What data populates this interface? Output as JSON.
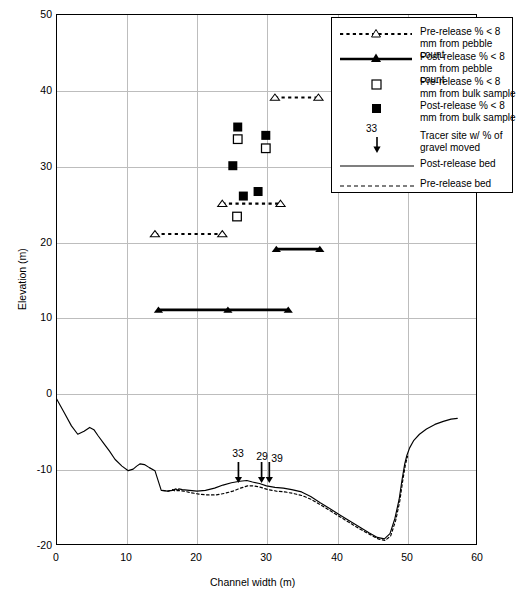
{
  "chart_data": {
    "type": "scatter",
    "title": "",
    "xlabel": "Channel width (m)",
    "ylabel": "Elevation (m)",
    "xlim": [
      0,
      60
    ],
    "ylim": [
      -20,
      50
    ],
    "xticks": [
      0,
      10,
      20,
      30,
      40,
      50,
      60
    ],
    "yticks": [
      -20,
      -10,
      0,
      10,
      20,
      30,
      40,
      50
    ],
    "grid": true,
    "legend_position": "top-right inside",
    "series": [
      {
        "name": "Pre-release % < 8 mm from pebble count",
        "style": "dashed-line-open-triangle",
        "segments": [
          {
            "x": [
              14.1,
              23.7
            ],
            "y": [
              21,
              21
            ]
          },
          {
            "x": [
              23.7,
              32.0
            ],
            "y": [
              25,
              25
            ]
          },
          {
            "x": [
              31.2,
              37.4
            ],
            "y": [
              39,
              39
            ]
          }
        ]
      },
      {
        "name": "Post-release % < 8 mm from pebble count",
        "style": "solid-line-filled-triangle",
        "segments": [
          {
            "x": [
              14.6,
              24.5,
              33.1
            ],
            "y": [
              11,
              11,
              11
            ]
          },
          {
            "x": [
              31.4,
              37.6
            ],
            "y": [
              19,
              19
            ]
          }
        ]
      },
      {
        "name": "Pre-release % < 8 mm from bulk sample",
        "style": "open-square",
        "points": [
          {
            "x": 25.9,
            "y": 33.5
          },
          {
            "x": 29.9,
            "y": 32.3
          },
          {
            "x": 25.8,
            "y": 23.3
          }
        ]
      },
      {
        "name": "Post-release % < 8 mm from bulk sample",
        "style": "filled-square",
        "points": [
          {
            "x": 25.9,
            "y": 35.1
          },
          {
            "x": 29.9,
            "y": 34.0
          },
          {
            "x": 25.2,
            "y": 30.0
          },
          {
            "x": 26.7,
            "y": 26.0
          },
          {
            "x": 28.8,
            "y": 26.6
          }
        ]
      },
      {
        "name": "Tracer site w/ % of gravel moved",
        "style": "down-arrow-with-label",
        "points": [
          {
            "x": 26.0,
            "label": "33"
          },
          {
            "x": 29.3,
            "label": "29"
          },
          {
            "x": 30.4,
            "label": "39"
          }
        ]
      },
      {
        "name": "Post-release bed",
        "style": "solid-line",
        "x": [
          0.0,
          1.2,
          2.2,
          3.1,
          4.0,
          4.8,
          5.4,
          6.0,
          6.8,
          7.6,
          8.4,
          9.4,
          10.3,
          11.0,
          11.5,
          12.0,
          12.6,
          13.3,
          14.1,
          15.0,
          15.9,
          16.6,
          17.1,
          17.3,
          17.5,
          18.0,
          19.0,
          20.1,
          21.3,
          22.6,
          23.8,
          25.0,
          26.2,
          27.2,
          28.0,
          29.0,
          30.0,
          31.2,
          32.4,
          33.6,
          35.0,
          36.3,
          37.6,
          39.0,
          40.4,
          41.8,
          43.2,
          44.6,
          45.8,
          46.8,
          47.6,
          48.3,
          48.9,
          49.3,
          49.7,
          50.0,
          50.4,
          51.0,
          51.8,
          52.8,
          54.0,
          55.2,
          56.3,
          57.2
        ],
        "y": [
          -0.6,
          -2.6,
          -4.3,
          -5.4,
          -5.0,
          -4.5,
          -4.8,
          -5.6,
          -6.6,
          -7.6,
          -8.7,
          -9.6,
          -10.2,
          -10.0,
          -9.6,
          -9.3,
          -9.4,
          -9.8,
          -10.2,
          -12.8,
          -12.9,
          -12.8,
          -12.6,
          -12.8,
          -12.6,
          -12.7,
          -12.8,
          -12.9,
          -12.8,
          -12.5,
          -12.1,
          -11.8,
          -11.6,
          -11.5,
          -11.7,
          -11.9,
          -12.2,
          -12.4,
          -12.5,
          -12.7,
          -13.0,
          -13.6,
          -14.4,
          -15.2,
          -16.0,
          -16.8,
          -17.6,
          -18.4,
          -19.0,
          -19.2,
          -18.5,
          -16.5,
          -14.0,
          -11.5,
          -9.3,
          -8.2,
          -7.2,
          -6.2,
          -5.4,
          -4.7,
          -4.1,
          -3.7,
          -3.4,
          -3.3
        ]
      },
      {
        "name": "Pre-release bed",
        "style": "dashed-line",
        "x": [
          15.2,
          16.0,
          16.6,
          17.0,
          17.4,
          18.2,
          19.2,
          20.4,
          21.6,
          22.8,
          24.0,
          25.2,
          26.3,
          27.3,
          28.2,
          29.2,
          30.2,
          31.4,
          32.6,
          33.8,
          35.1,
          36.4,
          37.7,
          39.1,
          40.5,
          41.9,
          43.3,
          44.7,
          45.9,
          46.9,
          47.7,
          48.4,
          49.0,
          49.4,
          49.8,
          50.1
        ],
        "y": [
          -12.8,
          -12.9,
          -12.7,
          -12.9,
          -12.8,
          -12.9,
          -13.1,
          -13.3,
          -13.4,
          -13.4,
          -13.2,
          -12.9,
          -12.5,
          -12.2,
          -12.2,
          -12.4,
          -12.7,
          -12.9,
          -13.0,
          -13.2,
          -13.5,
          -14.0,
          -14.7,
          -15.5,
          -16.3,
          -17.1,
          -17.9,
          -18.6,
          -19.2,
          -19.4,
          -18.8,
          -16.8,
          -14.2,
          -11.6,
          -9.4,
          -8.3
        ]
      }
    ]
  },
  "axes": {
    "ylabel": "Elevation (m)",
    "xlabel": "Channel width (m)",
    "yticks": [
      "50",
      "40",
      "30",
      "20",
      "10",
      "0",
      "-10",
      "-20"
    ],
    "xticks": [
      "0",
      "10",
      "20",
      "30",
      "40",
      "50",
      "60"
    ]
  },
  "legend": {
    "items": [
      {
        "key": "dashed-open-triangle",
        "label": "Pre-release % < 8 mm from pebble count"
      },
      {
        "key": "solid-filled-triangle",
        "label": "Post-release % < 8 mm from pebble count"
      },
      {
        "key": "open-square",
        "label": "Pre-release % < 8 mm from bulk sample"
      },
      {
        "key": "filled-square",
        "label": "Post-release % < 8 mm from bulk sample"
      },
      {
        "key": "down-arrow",
        "label": "Tracer site w/ % of gravel moved",
        "number": "33"
      },
      {
        "key": "solid-line",
        "label": "Post-release bed"
      },
      {
        "key": "dashed-line",
        "label": "Pre-release bed"
      }
    ]
  },
  "tracers": [
    {
      "label": "33",
      "x": 26.0
    },
    {
      "label": "29",
      "x": 29.3
    },
    {
      "label": "39",
      "x": 30.4
    }
  ],
  "colors": {
    "ink": "#000000",
    "grid": "#bdbdbd",
    "background": "#ffffff"
  }
}
